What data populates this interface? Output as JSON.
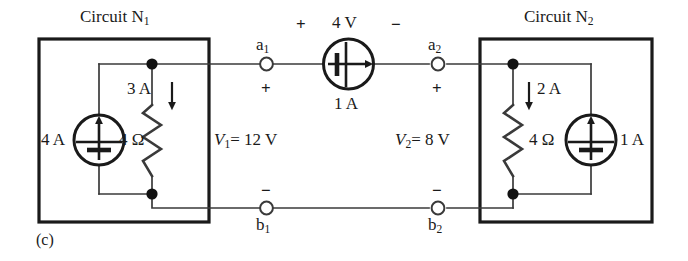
{
  "figure": {
    "caption": "(c)",
    "type": "circuit-diagram"
  },
  "left_circuit": {
    "title_prefix": "Circuit N",
    "title_sub": "1",
    "source_label": "4 A",
    "resistor_label": "4 Ω",
    "branch_current": "3 A",
    "branch_current_direction": "down",
    "port_voltage": "V",
    "port_voltage_sub": "1",
    "port_voltage_value": "= 12 V",
    "terminal_top": "a",
    "terminal_top_sub": "1",
    "terminal_bottom": "b",
    "terminal_bottom_sub": "1",
    "polarity_top": "+",
    "polarity_bottom": "−"
  },
  "center_source": {
    "voltage_label": "4 V",
    "current_label": "1 A",
    "polarity_left": "+",
    "polarity_right": "−",
    "arrow_direction": "right"
  },
  "right_circuit": {
    "title_prefix": "Circuit N",
    "title_sub": "2",
    "source_label": "1 A",
    "resistor_label": "4 Ω",
    "branch_current": "2 A",
    "branch_current_direction": "down",
    "port_voltage": "V",
    "port_voltage_sub": "2",
    "port_voltage_value": "= 8 V",
    "terminal_top": "a",
    "terminal_top_sub": "2",
    "terminal_bottom": "b",
    "terminal_bottom_sub": "2",
    "polarity_top": "+",
    "polarity_bottom": "−"
  },
  "colors": {
    "ink": "#1a1a1a",
    "wire": "#3a3a3a",
    "background": "#ffffff"
  }
}
